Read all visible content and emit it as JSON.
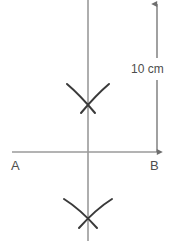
{
  "figure": {
    "background_color": "#ffffff",
    "width": 181,
    "height": 241
  },
  "colors": {
    "guide_line": "#9a9a9a",
    "arc_stroke": "#3a3a3a",
    "dimension_line": "#6e6e6e",
    "text": "#4d4d4d"
  },
  "labels": {
    "point_a": "A",
    "point_b": "B",
    "dimension": "10 cm"
  },
  "geometry": {
    "baseline": {
      "x1": 12,
      "y1": 152,
      "x2": 158,
      "y2": 152
    },
    "perpendicular": {
      "x": 88,
      "y1": 0,
      "y2": 241
    },
    "intersection": {
      "x": 88,
      "y": 152
    },
    "upper_cross": {
      "x": 88,
      "y": 99
    },
    "lower_cross": {
      "x": 88,
      "y": 213
    },
    "dimension_line": {
      "x": 157,
      "y_top": 4,
      "y_bottom": 152
    },
    "dimension_label_gap": {
      "y1": 58,
      "y2": 80
    }
  },
  "arcs": {
    "upper": [
      {
        "name": "arc-from-a-upper",
        "d": "M 67 84 Q 80 95 95 113"
      },
      {
        "name": "arc-from-b-upper",
        "d": "M 109 84 Q 96 95 81 113"
      }
    ],
    "lower": [
      {
        "name": "arc-from-a-lower",
        "d": "M 64 199 Q 80 209 97 228"
      },
      {
        "name": "arc-from-b-lower",
        "d": "M 112 199 Q 96 209 79 228"
      }
    ]
  },
  "annotations": {
    "point_a_pos": {
      "x": 11,
      "y": 170
    },
    "point_b_pos": {
      "x": 150,
      "y": 170
    },
    "dimension_text_pos": {
      "x": 131,
      "y": 73
    }
  }
}
